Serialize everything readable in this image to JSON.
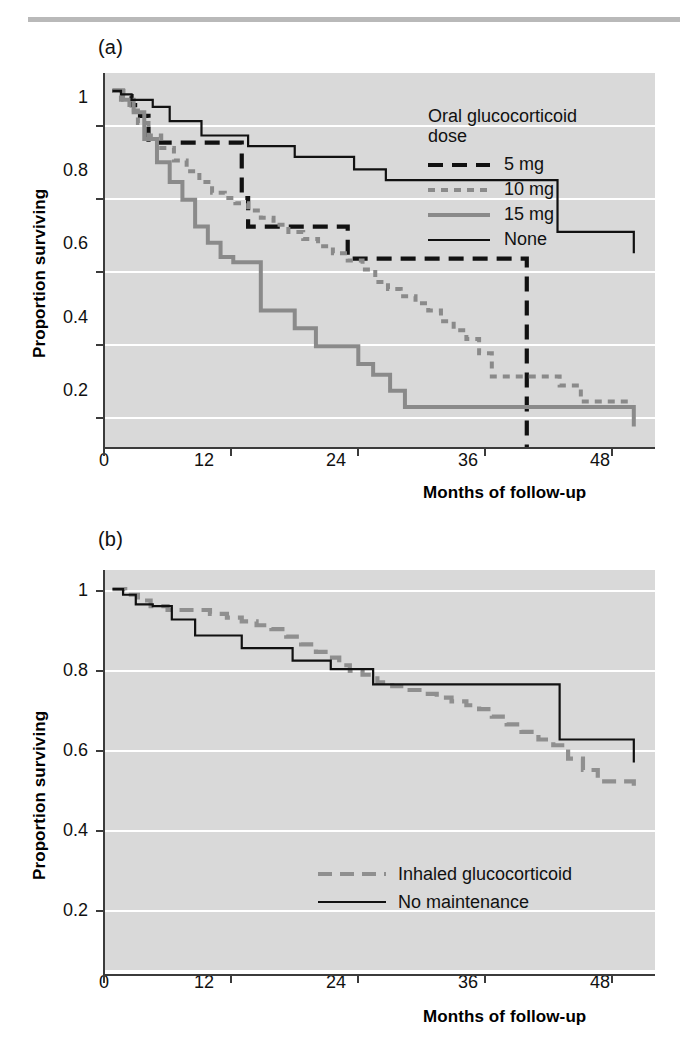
{
  "figure": {
    "top_rule_color": "#b9b9b9",
    "plot_background": "#d9d9d9",
    "gridline_color": "#ffffff"
  },
  "panels": [
    {
      "id": "a",
      "letter": "(a)",
      "ylabel": "Proportion surviving",
      "xlabel": "Months of follow-up",
      "legend_title_line1": "Oral glucocorticoid",
      "legend_title_line2": "dose",
      "legend": [
        {
          "label": "5 mg",
          "style": "black-dash",
          "color": "#111111"
        },
        {
          "label": "10 mg",
          "style": "gray-dot",
          "color": "#8a8a8a"
        },
        {
          "label": "15 mg",
          "style": "gray-solid",
          "color": "#8a8a8a"
        },
        {
          "label": "None",
          "style": "black-thin",
          "color": "#111111"
        }
      ]
    },
    {
      "id": "b",
      "letter": "(b)",
      "ylabel": "Proportion surviving",
      "xlabel": "Months of follow-up",
      "legend": [
        {
          "label": "Inhaled glucocorticoid",
          "style": "gray-dash",
          "color": "#8f8f8f"
        },
        {
          "label": "No maintenance",
          "style": "black-thin",
          "color": "#111111"
        }
      ]
    }
  ],
  "chart_data": [
    {
      "type": "line",
      "subplot": "a",
      "title": "(a) Survival by oral glucocorticoid dose",
      "xlabel": "Months of follow-up",
      "ylabel": "Proportion surviving",
      "xlim": [
        0,
        52
      ],
      "ylim": [
        0.0,
        1.05
      ],
      "xticks": [
        0,
        12,
        24,
        36,
        48
      ],
      "yticks": [
        0.2,
        0.4,
        0.6,
        0.8,
        1.0
      ],
      "grid": "horizontal",
      "legend_position": "top-right",
      "legend_title": "Oral glucocorticoid dose",
      "step": "post",
      "series": [
        {
          "name": "5 mg",
          "style": "black-dash",
          "x": [
            0.8,
            1.8,
            2.6,
            3.4,
            4.2,
            12.2,
            13.0,
            13.6,
            23.0,
            39.9,
            39.9
          ],
          "y": [
            1.0,
            0.985,
            0.96,
            0.93,
            0.855,
            0.855,
            0.7,
            0.62,
            0.53,
            0.53,
            0.0
          ]
        },
        {
          "name": "10 mg",
          "style": "gray-dot",
          "x": [
            0.8,
            1.6,
            2.4,
            3.2,
            4.2,
            5.4,
            6.6,
            7.8,
            9.0,
            10.2,
            11.4,
            12.4,
            13.6,
            14.8,
            16.0,
            17.4,
            18.8,
            20.2,
            21.6,
            23.0,
            24.4,
            25.6,
            26.8,
            28.0,
            29.4,
            30.6,
            31.8,
            33.0,
            34.2,
            35.4,
            36.6,
            40.0,
            43.0,
            45.0,
            50.0
          ],
          "y": [
            1.0,
            0.975,
            0.945,
            0.91,
            0.875,
            0.84,
            0.805,
            0.775,
            0.745,
            0.715,
            0.7,
            0.685,
            0.665,
            0.645,
            0.625,
            0.605,
            0.585,
            0.565,
            0.545,
            0.525,
            0.5,
            0.465,
            0.445,
            0.425,
            0.405,
            0.385,
            0.355,
            0.33,
            0.305,
            0.265,
            0.2,
            0.2,
            0.175,
            0.13,
            0.13
          ]
        },
        {
          "name": "15 mg",
          "style": "gray-solid",
          "x": [
            0.8,
            1.8,
            2.8,
            3.8,
            5.0,
            6.2,
            7.4,
            8.6,
            9.8,
            11.0,
            12.2,
            13.4,
            14.8,
            16.2,
            18.0,
            20.0,
            22.0,
            24.0,
            25.4,
            27.0,
            28.4,
            29.8,
            42.5,
            50.0
          ],
          "y": [
            1.0,
            0.975,
            0.94,
            0.865,
            0.8,
            0.745,
            0.695,
            0.62,
            0.575,
            0.535,
            0.52,
            0.52,
            0.385,
            0.385,
            0.335,
            0.285,
            0.285,
            0.235,
            0.205,
            0.16,
            0.115,
            0.115,
            0.115,
            0.06
          ]
        },
        {
          "name": "None",
          "style": "black-thin",
          "x": [
            0.8,
            1.6,
            2.6,
            4.6,
            6.2,
            9.2,
            13.6,
            18.0,
            21.0,
            23.6,
            26.6,
            34.8,
            42.8,
            50.0
          ],
          "y": [
            1.0,
            0.99,
            0.975,
            0.955,
            0.915,
            0.875,
            0.845,
            0.815,
            0.815,
            0.78,
            0.75,
            0.75,
            0.605,
            0.545
          ]
        }
      ]
    },
    {
      "type": "line",
      "subplot": "b",
      "title": "(b) Survival by inhaled glucocorticoid maintenance",
      "xlabel": "Months of follow-up",
      "ylabel": "Proportion surviving",
      "xlim": [
        0,
        52
      ],
      "ylim": [
        0.0,
        1.05
      ],
      "xticks": [
        0,
        12,
        24,
        36,
        48
      ],
      "yticks": [
        0.2,
        0.4,
        0.6,
        0.8,
        1.0
      ],
      "grid": "horizontal",
      "legend_position": "bottom-right",
      "step": "post",
      "series": [
        {
          "name": "Inhaled glucocorticoid",
          "style": "gray-dash",
          "x": [
            0.8,
            2.0,
            3.2,
            4.4,
            6.0,
            8.0,
            10.0,
            11.6,
            13.0,
            14.4,
            15.8,
            17.2,
            18.6,
            20.0,
            21.2,
            22.2,
            23.2,
            24.4,
            25.8,
            27.2,
            28.6,
            30.0,
            31.4,
            32.8,
            34.2,
            35.4,
            36.6,
            38.0,
            39.4,
            41.0,
            42.4,
            43.8,
            45.2,
            46.6,
            50.0
          ],
          "y": [
            1.0,
            0.985,
            0.97,
            0.955,
            0.945,
            0.945,
            0.935,
            0.925,
            0.915,
            0.905,
            0.895,
            0.875,
            0.855,
            0.835,
            0.82,
            0.8,
            0.785,
            0.775,
            0.755,
            0.745,
            0.735,
            0.725,
            0.715,
            0.705,
            0.695,
            0.685,
            0.665,
            0.645,
            0.625,
            0.605,
            0.59,
            0.555,
            0.525,
            0.495,
            0.478
          ]
        },
        {
          "name": "No maintenance",
          "style": "black-thin",
          "x": [
            0.8,
            1.8,
            3.0,
            4.6,
            6.4,
            8.6,
            13.0,
            17.8,
            21.4,
            23.2,
            25.4,
            34.5,
            43.0,
            50.0
          ],
          "y": [
            1.0,
            0.985,
            0.96,
            0.955,
            0.92,
            0.878,
            0.845,
            0.812,
            0.79,
            0.79,
            0.75,
            0.75,
            0.605,
            0.545
          ]
        }
      ]
    }
  ]
}
